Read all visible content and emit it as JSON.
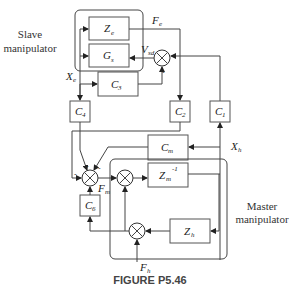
{
  "figure": {
    "caption": "FIGURE P5.46",
    "groups": {
      "slave_label_line1": "Slave",
      "slave_label_line2": "manipulator",
      "master_label_line1": "Master",
      "master_label_line2": "manipulator"
    },
    "blocks": {
      "Ze": {
        "main": "Z",
        "sub": "e"
      },
      "Gs": {
        "main": "G",
        "sub": "s"
      },
      "C3": {
        "main": "C",
        "sub": "3"
      },
      "C4": {
        "main": "C",
        "sub": "4"
      },
      "C2": {
        "main": "C",
        "sub": "2"
      },
      "C1": {
        "main": "C",
        "sub": "1"
      },
      "Cm": {
        "main": "C",
        "sub": "m"
      },
      "Zm_inv": {
        "main": "Z",
        "sub": "m",
        "sup": "-1"
      },
      "C6": {
        "main": "C",
        "sub": "6"
      },
      "Zh": {
        "main": "Z",
        "sub": "h"
      }
    },
    "signals": {
      "Fe": {
        "main": "F",
        "sub": "e"
      },
      "Vsd": {
        "main": "V",
        "sub": "sd"
      },
      "Xe": {
        "main": "X",
        "sub": "e"
      },
      "Xh": {
        "main": "X",
        "sub": "h"
      },
      "Fm": {
        "main": "F",
        "sub": "m"
      },
      "Fh": {
        "main": "F",
        "sub": "h"
      }
    },
    "signs": {
      "minus": "-",
      "plus": "+"
    }
  }
}
